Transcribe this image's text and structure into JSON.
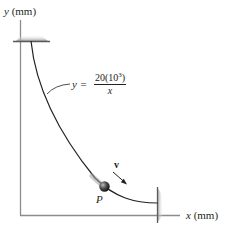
{
  "diagram": {
    "title": "",
    "axes": {
      "y_label_var": "y",
      "y_label_unit": "(mm)",
      "x_label_var": "x",
      "x_label_unit": "(mm)"
    },
    "curve": {
      "equation_lhs": "y =",
      "equation_numerator": "20(10",
      "equation_exponent": "3",
      "equation_numerator_close": ")",
      "equation_denominator": "x"
    },
    "particle": {
      "label": "P",
      "velocity_label": "v"
    },
    "supports": [
      "top-fixed-support",
      "right-fixed-support"
    ],
    "colors": {
      "line": "#231f20",
      "axis": "#8c8c8c",
      "support_shade": "#a9a9a9",
      "particle": "#3a3a3a"
    }
  }
}
